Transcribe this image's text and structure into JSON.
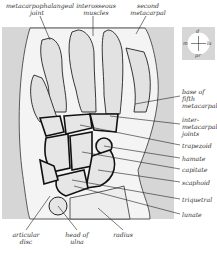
{
  "diagram": {
    "labels_top": [
      {
        "id": "metacarpophalangeal-joint",
        "text": "metacarpophalangeal\njoint",
        "x": 6,
        "y": 2,
        "w": 62
      },
      {
        "id": "interosseous-muscles",
        "text": "interosseous\nmuscles",
        "x": 74,
        "y": 2,
        "w": 44
      },
      {
        "id": "second-metacarpal",
        "text": "second\nmetacarpal",
        "x": 128,
        "y": 2,
        "w": 40
      }
    ],
    "labels_right": [
      {
        "id": "base-of-fifth-metacarpal",
        "text": "base of\nfifth\nmetacarpal",
        "x": 182,
        "y": 88
      },
      {
        "id": "intermetacarpal-joints",
        "text": "inter-\nmetacarpal\njoints",
        "x": 182,
        "y": 116
      },
      {
        "id": "trapezoid",
        "text": "trapezoid",
        "x": 182,
        "y": 142
      },
      {
        "id": "hamate",
        "text": "hamate",
        "x": 182,
        "y": 155
      },
      {
        "id": "capitate",
        "text": "capitate",
        "x": 182,
        "y": 166
      },
      {
        "id": "scaphoid",
        "text": "scaphoid",
        "x": 182,
        "y": 179
      },
      {
        "id": "triquetral",
        "text": "triquetral",
        "x": 182,
        "y": 196
      },
      {
        "id": "lunate",
        "text": "lunate",
        "x": 182,
        "y": 211
      }
    ],
    "labels_bottom": [
      {
        "id": "articular-disc",
        "text": "articular\ndisc",
        "x": 8,
        "y": 230,
        "w": 36
      },
      {
        "id": "head-of-ulna",
        "text": "head of\nulna",
        "x": 60,
        "y": 230,
        "w": 34
      },
      {
        "id": "radius",
        "text": "radius",
        "x": 108,
        "y": 230,
        "w": 30
      }
    ],
    "compass": {
      "top": "d",
      "left": "m",
      "right": "la",
      "bottom": "pr"
    },
    "colors": {
      "background": "#ffffff",
      "panel": "#d8d8d8",
      "bone": "#ececec",
      "outline": "#222222",
      "joint": "#111111"
    }
  }
}
